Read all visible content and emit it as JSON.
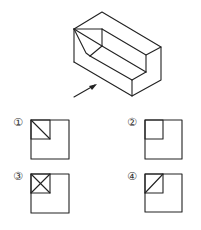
{
  "figure": {
    "stroke_color": "#222222",
    "background": "#ffffff"
  },
  "options": [
    {
      "label": "①",
      "inner_mark": "diagonal top-left to bottom-right"
    },
    {
      "label": "②",
      "inner_mark": "none"
    },
    {
      "label": "③",
      "inner_mark": "X cross"
    },
    {
      "label": "④",
      "inner_mark": "diagonal bottom-left to top-right"
    }
  ]
}
